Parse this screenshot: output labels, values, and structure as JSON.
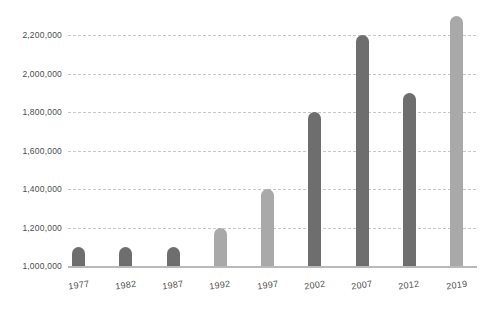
{
  "chart_data": {
    "type": "bar",
    "title": "",
    "xlabel": "",
    "ylabel": "",
    "categories": [
      "1977",
      "1982",
      "1987",
      "1992",
      "1997",
      "2002",
      "2007",
      "2012",
      "2019"
    ],
    "values": [
      1100000,
      1100000,
      1100000,
      1200000,
      1400000,
      1800000,
      2200000,
      1900000,
      2300000
    ],
    "bar_colors": [
      "dark",
      "dark",
      "dark",
      "light",
      "light",
      "dark",
      "dark",
      "dark",
      "light"
    ],
    "colors": {
      "dark": "#6e6e6e",
      "light": "#a9a9a9"
    },
    "yticks": [
      1000000,
      1200000,
      1400000,
      1600000,
      1800000,
      2000000,
      2200000
    ],
    "ytick_labels": [
      "1,000,000",
      "1,200,000",
      "1,400,000",
      "1,600,000",
      "1,800,000",
      "2,000,000",
      "2,200,000"
    ],
    "ylim": [
      1000000,
      2300000
    ],
    "grid": "horizontal-dashed",
    "legend": "none",
    "background": "#ffffff",
    "gridline_color": "#c7c7c7",
    "axis_line_color": "#b9b9b9",
    "label_color": "#4d4d4d"
  }
}
